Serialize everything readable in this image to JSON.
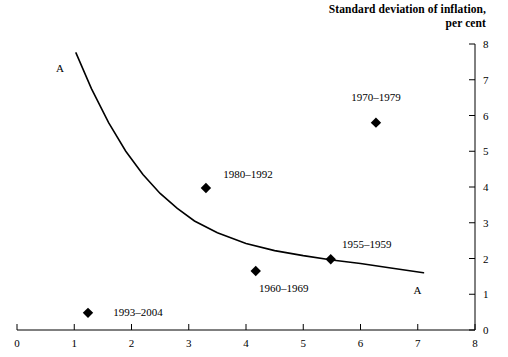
{
  "title": {
    "line1": "Standard deviation of inflation,",
    "line2": "per cent"
  },
  "axes": {
    "x_ticks": [
      "0",
      "1",
      "2",
      "3",
      "4",
      "5",
      "6",
      "7",
      "8"
    ],
    "y_ticks": [
      "0",
      "1",
      "2",
      "3",
      "4",
      "5",
      "6",
      "7",
      "8"
    ],
    "x_axis_name": "x-axis",
    "y_axis_name": "y-axis-right"
  },
  "curve": {
    "label_left": "A",
    "label_right": "A"
  },
  "points": [
    {
      "label": "1970–1979",
      "x": 6.27,
      "y": 5.8
    },
    {
      "label": "1980–1992",
      "x": 3.3,
      "y": 3.97
    },
    {
      "label": "1955–1959",
      "x": 5.48,
      "y": 1.98
    },
    {
      "label": "1960–1969",
      "x": 4.17,
      "y": 1.65
    },
    {
      "label": "1993–2004",
      "x": 1.24,
      "y": 0.48
    }
  ],
  "colors": {
    "ink": "#000000",
    "background": "#ffffff"
  },
  "chart_data": {
    "type": "scatter",
    "title": "Standard deviation of inflation, per cent",
    "xlabel": "",
    "ylabel": "Standard deviation of inflation, per cent",
    "xlim": [
      0,
      8
    ],
    "ylim": [
      0,
      8
    ],
    "grid": false,
    "legend": "none",
    "y_axis_position": "right",
    "x_ticks": [
      0,
      1,
      2,
      3,
      4,
      5,
      6,
      7,
      8
    ],
    "y_ticks": [
      0,
      1,
      2,
      3,
      4,
      5,
      6,
      7,
      8
    ],
    "series": [
      {
        "name": "Decade observations",
        "type": "scatter",
        "marker": "diamond",
        "color": "#000000",
        "points": [
          {
            "label": "1970–1979",
            "x": 6.27,
            "y": 5.8
          },
          {
            "label": "1980–1992",
            "x": 3.3,
            "y": 3.97
          },
          {
            "label": "1955–1959",
            "x": 5.48,
            "y": 1.98
          },
          {
            "label": "1960–1969",
            "x": 4.17,
            "y": 1.65
          },
          {
            "label": "1993–2004",
            "x": 1.24,
            "y": 0.48
          }
        ]
      },
      {
        "name": "A",
        "type": "line",
        "color": "#000000",
        "annotation_left": "A",
        "annotation_right": "A",
        "x": [
          1.03,
          1.3,
          1.6,
          1.9,
          2.2,
          2.5,
          2.8,
          3.1,
          3.5,
          4.0,
          4.5,
          5.0,
          5.5,
          6.0,
          6.5,
          7.1
        ],
        "y": [
          7.75,
          6.75,
          5.8,
          5.0,
          4.35,
          3.82,
          3.4,
          3.05,
          2.72,
          2.42,
          2.22,
          2.08,
          1.96,
          1.86,
          1.74,
          1.6
        ]
      }
    ]
  }
}
